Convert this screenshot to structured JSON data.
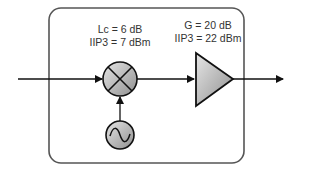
{
  "diagram": {
    "mixer": {
      "label_line1": "Lc = 6 dB",
      "label_line2": "IIP3 = 7 dBm",
      "icon": "mixer-cross-icon"
    },
    "amplifier": {
      "label_line1": "G = 20 dB",
      "label_line2": "IIP3 = 22 dBm",
      "icon": "amplifier-triangle-icon"
    },
    "oscillator": {
      "icon": "sine-wave-icon"
    },
    "colors": {
      "stroke": "#1a1a1a",
      "box": "#555555",
      "fill_light": "#e0e0e0",
      "fill_dark": "#9a9a9a"
    }
  }
}
